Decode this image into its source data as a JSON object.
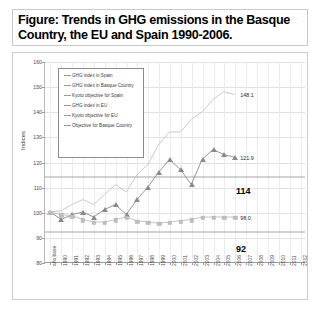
{
  "title": "Figure: Trends in GHG emissions in the Basque Country, the EU and Spain 1990-2006.",
  "legend": {
    "items": [
      {
        "key": "dash",
        "label": "GHG index in Spain"
      },
      {
        "key": "dash",
        "label": "GHG index in Basque Country"
      },
      {
        "key": "dash",
        "label": "Kyoto objective for Spain"
      },
      {
        "key": "dash",
        "label": "GHG index in EU"
      },
      {
        "key": "dash",
        "label": "Kyoto objective for EU"
      },
      {
        "key": "dash",
        "label": "Objective for Basque Country"
      }
    ]
  },
  "chart_data": {
    "type": "line",
    "title": "Trends in GHG emissions in the Basque Country, the EU and Spain 1990-2006",
    "xlabel": "",
    "ylabel": "Indices",
    "ylim": [
      80,
      160
    ],
    "yticks": [
      80,
      90,
      100,
      110,
      120,
      130,
      140,
      150,
      160
    ],
    "grid": true,
    "legend_position": "inside-top-left",
    "x": [
      "año base",
      "1990",
      "1991",
      "1992",
      "1993",
      "1994",
      "1995",
      "1996",
      "1997",
      "1998",
      "1999",
      "2000",
      "2001",
      "2002",
      "2003",
      "2004",
      "2005",
      "2006",
      "2007",
      "2008",
      "2009",
      "2010",
      "2011",
      "2012"
    ],
    "series": [
      {
        "name": "GHG index in Spain",
        "marker": "line",
        "color": "#c4c4c4",
        "values": [
          100,
          100.5,
          103,
          105,
          103,
          107,
          111,
          108,
          115,
          119,
          127,
          132,
          132,
          137,
          140,
          145,
          148.1,
          147,
          null,
          null,
          null,
          null,
          null,
          null
        ],
        "end_label": "148.1"
      },
      {
        "name": "GHG index in Basque Country",
        "marker": "triangle",
        "color": "#8a8a8a",
        "values": [
          100,
          97,
          99,
          100,
          98,
          101,
          103,
          99,
          105,
          110,
          116,
          121,
          117,
          111,
          121,
          125,
          123,
          121.9,
          null,
          null,
          null,
          null,
          null,
          null
        ],
        "end_label": "121.9"
      },
      {
        "name": "GHG index in EU",
        "marker": "square",
        "color": "#bdbdbd",
        "values": [
          100,
          99,
          98.5,
          97,
          96,
          96,
          97,
          98,
          96.5,
          96,
          95.5,
          96,
          96.5,
          97,
          98,
          98,
          98,
          98.0,
          null,
          null,
          null,
          null,
          null,
          null
        ],
        "end_label": "98.0"
      }
    ],
    "target_lines": [
      {
        "name": "Kyoto objective for Spain",
        "value": 114,
        "label": "114",
        "color": "#9a9a9a"
      },
      {
        "name": "Kyoto objective for EU",
        "value": 92,
        "label": "92",
        "color": "#9a9a9a"
      }
    ]
  }
}
